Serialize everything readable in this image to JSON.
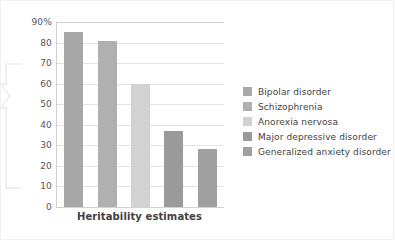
{
  "chart_data": {
    "type": "bar",
    "title": "",
    "subtitle": "",
    "xlabel": "Heritability estimates",
    "ylabel": "",
    "categories": [
      "Bipolar disorder",
      "Schizophrenia",
      "Anorexia nervosa",
      "Major depressive disorder",
      "Generalized anxiety disorder"
    ],
    "values": [
      85,
      81,
      60,
      37,
      28
    ],
    "ylim": [
      0,
      90
    ],
    "ytick_labels": [
      "90%",
      "80",
      "70",
      "60",
      "50",
      "40",
      "30",
      "20",
      "10",
      "0"
    ],
    "ytick_values": [
      90,
      80,
      70,
      60,
      50,
      40,
      30,
      20,
      10,
      0
    ],
    "grid": true,
    "legend_position": "right",
    "legend": [
      {
        "label": "Bipolar disorder",
        "color": "#a8a8a8"
      },
      {
        "label": "Schizophrenia",
        "color": "#b0b0b0"
      },
      {
        "label": "Anorexia nervosa",
        "color": "#d2d2d2"
      },
      {
        "label": "Major depressive disorder",
        "color": "#9a9a9a"
      },
      {
        "label": "Generalized anxiety disorder",
        "color": "#a0a0a0"
      }
    ],
    "bar_colors": [
      "#a8a8a8",
      "#b0b0b0",
      "#d2d2d2",
      "#9a9a9a",
      "#a0a0a0"
    ]
  },
  "style": {
    "background": "#ffffff",
    "gridline_color": "#e3e3e3",
    "axis_color": "#d2d2d2",
    "text_color": "#3f4043",
    "frame_color": "#f1f1f1",
    "callout_color": "#f4f4f4"
  }
}
